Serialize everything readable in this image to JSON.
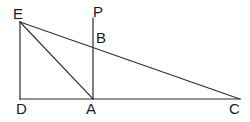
{
  "figure": {
    "kind": "geometry-diagram",
    "canvas": {
      "width": 250,
      "height": 122,
      "background": "#ffffff"
    },
    "stroke": {
      "color": "#2b2b2b",
      "width": 1.2
    },
    "labels": [
      {
        "id": "E",
        "text": "E",
        "x": 13,
        "y": 6
      },
      {
        "id": "P",
        "text": "P",
        "x": 93,
        "y": 4
      },
      {
        "id": "B",
        "text": "B",
        "x": 96,
        "y": 30
      },
      {
        "id": "D",
        "text": "D",
        "x": 16,
        "y": 101
      },
      {
        "id": "A",
        "text": "A",
        "x": 86,
        "y": 101
      },
      {
        "id": "C",
        "text": "C",
        "x": 229,
        "y": 101
      }
    ],
    "points": [
      {
        "id": "E",
        "x": 20,
        "y": 22
      },
      {
        "id": "P",
        "x": 93,
        "y": 18
      },
      {
        "id": "B",
        "x": 93,
        "y": 42
      },
      {
        "id": "D",
        "x": 20,
        "y": 99
      },
      {
        "id": "A",
        "x": 93,
        "y": 99
      },
      {
        "id": "C",
        "x": 240,
        "y": 99
      }
    ],
    "segments": [
      {
        "id": "ED",
        "name": "segment-ed",
        "x1": 20,
        "y1": 22,
        "x2": 20,
        "y2": 99
      },
      {
        "id": "DC",
        "name": "segment-dc",
        "x1": 20,
        "y1": 99,
        "x2": 240,
        "y2": 99
      },
      {
        "id": "EC",
        "name": "segment-ec",
        "x1": 20,
        "y1": 22,
        "x2": 240,
        "y2": 99
      },
      {
        "id": "EA",
        "name": "segment-ea",
        "x1": 20,
        "y1": 22,
        "x2": 93,
        "y2": 99
      },
      {
        "id": "PA",
        "name": "segment-pa",
        "x1": 93,
        "y1": 18,
        "x2": 93,
        "y2": 99
      }
    ]
  }
}
